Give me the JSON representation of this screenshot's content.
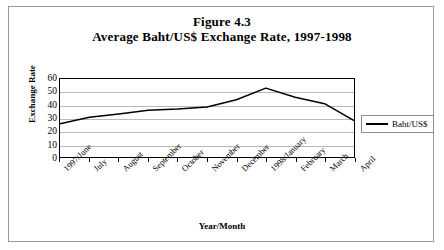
{
  "figure": {
    "title_main": "Figure 4.3",
    "title_sub": "Average Baht/US$ Exchange Rate, 1997-1998"
  },
  "legend": {
    "position": "right",
    "entries": [
      {
        "label": "Baht/US$",
        "color": "#000000"
      }
    ]
  },
  "axes": {
    "ylabel": "Exchange Rate",
    "xlabel": "Year/Month"
  },
  "colors": {
    "series_line": "#000000",
    "gridline": "#b9b9b9",
    "plot_border": "#000000",
    "frame_border": "#9a9a9a",
    "text": "#000000"
  },
  "chart_data": {
    "type": "line",
    "title": "Average Baht/US$ Exchange Rate, 1997-1998",
    "xlabel": "Year/Month",
    "ylabel": "Exchange Rate",
    "ylim": [
      0,
      60
    ],
    "yticks": [
      0,
      10,
      20,
      30,
      40,
      50,
      60
    ],
    "grid": true,
    "legend_position": "right",
    "categories": [
      "1997/June",
      "July",
      "August",
      "September",
      "October",
      "November",
      "December",
      "1998/January",
      "February",
      "March",
      "April"
    ],
    "series": [
      {
        "name": "Baht/US$",
        "color": "#000000",
        "values": [
          25.5,
          30.5,
          33,
          36,
          37,
          38.5,
          44,
          53,
          46,
          41,
          28
        ]
      }
    ]
  }
}
